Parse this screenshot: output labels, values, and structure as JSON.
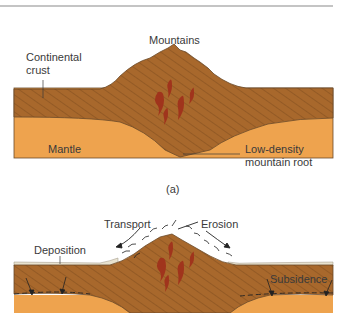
{
  "figure": {
    "panel_a": {
      "caption": "(a)",
      "labels": {
        "mountains": "Mountains",
        "continental_crust_line1": "Continental",
        "continental_crust_line2": "crust",
        "mantle": "Mantle",
        "root_line1": "Low-density",
        "root_line2": "mountain root"
      }
    },
    "panel_b": {
      "labels": {
        "transport": "Transport",
        "erosion": "Erosion",
        "deposition": "Deposition",
        "subsidence": "Subsidence"
      }
    },
    "colors": {
      "crust": "#a8682c",
      "crust_stripe": "#7a4a1c",
      "mantle": "#eea34e",
      "magma": "#a0341c",
      "sediment": "#e8e2cf",
      "rule": "#8a8a8a"
    }
  }
}
